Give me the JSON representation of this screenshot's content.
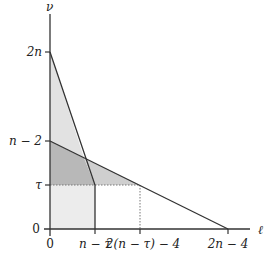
{
  "diagram": {
    "axes": {
      "x_label": "ℓ",
      "y_label": "ν",
      "x_ticks": [
        {
          "label": "0",
          "x": 50
        },
        {
          "label": "n − τ",
          "x": 95
        },
        {
          "label": "2(n − τ) − 4",
          "x": 140
        },
        {
          "label": "2n − 4",
          "x": 228
        }
      ],
      "y_ticks": [
        {
          "label": "2n",
          "y": 52
        },
        {
          "label": "n − 2",
          "y": 141
        },
        {
          "label": "τ",
          "y": 185
        },
        {
          "label": "0",
          "y": 229
        }
      ]
    },
    "regions": [
      {
        "name": "light-triangle-upper",
        "fill": "#e4e4e4"
      },
      {
        "name": "dark-quad",
        "fill": "#b9b9b9"
      },
      {
        "name": "medium-triangle-right",
        "fill": "#d0d0d0"
      },
      {
        "name": "light-rect-lower",
        "fill": "#ececec"
      }
    ],
    "colors": {
      "line": "#333333",
      "dotted": "#777777"
    }
  }
}
